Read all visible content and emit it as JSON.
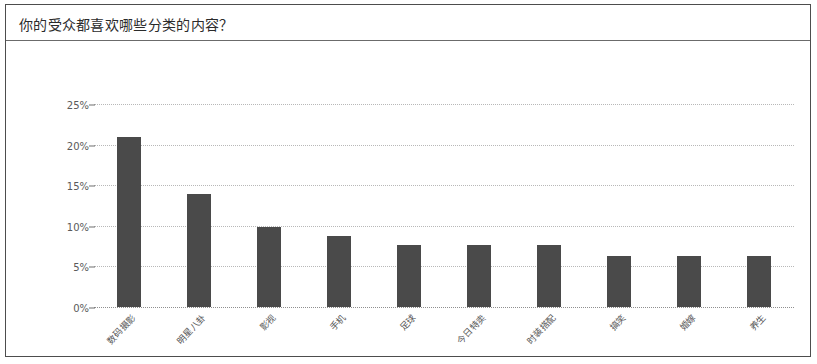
{
  "header": {
    "title": "你的受众都喜欢哪些分类的内容？"
  },
  "colors": {
    "bar": "#4a4a4a",
    "grid": "#b8b8b8",
    "border": "#4d4d4d",
    "text": "#2b2b2b",
    "tick_text": "#5a5a5a",
    "background": "#ffffff"
  },
  "chart_data": {
    "type": "bar",
    "title": "你的受众都喜欢哪些分类的内容？",
    "xlabel": "",
    "ylabel": "",
    "ylim": [
      0,
      25
    ],
    "yticks": [
      0,
      5,
      10,
      15,
      20,
      25
    ],
    "ytick_labels": [
      "0%",
      "5%",
      "10%",
      "15%",
      "20%",
      "25%"
    ],
    "unit": "%",
    "grid": true,
    "grid_style": "dotted-horizontal",
    "legend": false,
    "orientation": "vertical",
    "xtick_rotation": -47,
    "categories": [
      "数码摄影",
      "明星八卦",
      "影视",
      "手机",
      "足球",
      "今日特卖",
      "时装搭配",
      "搞笑",
      "婚嫁",
      "养生"
    ],
    "values": [
      20.9,
      13.9,
      9.8,
      8.8,
      7.6,
      7.6,
      7.6,
      6.3,
      6.3,
      6.3
    ],
    "value_labels": [
      "20.9%",
      "13.9%",
      "9.8%",
      "8.8%",
      "7.6%",
      "7.6%",
      "7.6%",
      "6.3%",
      "6.3%",
      "6.3%"
    ]
  }
}
